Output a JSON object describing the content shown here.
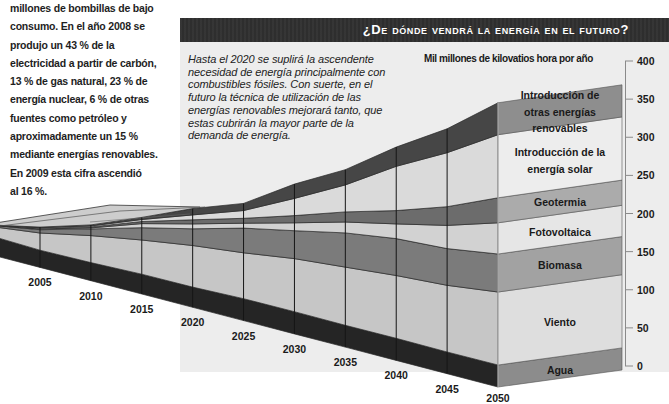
{
  "left_column": {
    "lines": [
      "millones de bombillas de bajo",
      "consumo. En el año 2008 se",
      "produjo un 43 % de la",
      "electricidad a partir de carbón,",
      "13 % de gas natural, 23 % de",
      "energía nuclear, 6 % de otras",
      "fuentes como petróleo y",
      "aproximadamente un 15 %",
      "mediante energías renovables.",
      "En 2009 esta cifra ascendió",
      "al 16 %."
    ]
  },
  "title_bar": {
    "title": "¿De dónde vendrá la energía en el futuro?",
    "background": "#2f2f2f"
  },
  "intro": {
    "lines": [
      "Hasta el 2020 se suplirá la ascendente",
      "necesidad de energía principalmente con",
      "combustibles fósiles. Con suerte, en el",
      "futuro la técnica de utilización de las",
      "energías renovables mejorará tanto, que",
      "estas cubrirán la mayor parte de la",
      "demanda de energía."
    ]
  },
  "chart_data": {
    "type": "area",
    "subtype": "stacked-3d-perspective",
    "title": "¿De dónde vendrá la energía en el futuro?",
    "xlabel": "",
    "ylabel": "Mil millones de kilovatios hora por año",
    "x": [
      2000,
      2005,
      2010,
      2015,
      2020,
      2025,
      2030,
      2035,
      2040,
      2045,
      2050
    ],
    "x_tick_labels": [
      "2005",
      "2010",
      "2015",
      "2020",
      "2025",
      "2030",
      "2035",
      "2040",
      "2045",
      "2050"
    ],
    "yticks": [
      0,
      50,
      100,
      150,
      200,
      250,
      300,
      350,
      400
    ],
    "ylim": [
      0,
      400
    ],
    "y_axis_position": "right",
    "grid": false,
    "legend": "labels on 2050 front face",
    "series": [
      {
        "name": "Agua",
        "label": "Agua",
        "values": [
          29,
          26,
          27,
          29,
          29,
          31,
          31,
          30,
          30,
          29,
          29
        ],
        "side_color": "#252525",
        "front_color": "#8c8c8c"
      },
      {
        "name": "Viento",
        "label": "Viento",
        "values": [
          14,
          26,
          40,
          50,
          60,
          65,
          74,
          80,
          85,
          89,
          96
        ],
        "side_color": "#c6c6c6",
        "front_color": "#dedede"
      },
      {
        "name": "Biomasa",
        "label": "Biomasa",
        "values": [
          2,
          5,
          10,
          18,
          24,
          35,
          39,
          47,
          50,
          49,
          50
        ],
        "side_color": "#7b7b7b",
        "front_color": "#a2a2a2"
      },
      {
        "name": "Fotovoltaica",
        "label": "Fotovoltaica",
        "values": [
          0,
          1,
          1.5,
          6,
          7,
          7,
          11,
          15,
          20,
          31,
          41
        ],
        "side_color": "#d2d2d2",
        "front_color": "#e6e6e6"
      },
      {
        "name": "Geotermia",
        "label": "Geotermia",
        "values": [
          0,
          1,
          1.5,
          3,
          6,
          7,
          10,
          14,
          18,
          25,
          33
        ],
        "side_color": "#6c6c6c",
        "front_color": "#ababab"
      },
      {
        "name": "Introducción de la energía solar",
        "label": "Introducción de la\nenergía solar",
        "values": [
          0,
          1,
          1.5,
          3,
          7,
          11,
          24,
          37,
          60,
          72,
          83
        ],
        "side_color": "#dadada",
        "front_color": "#ededed"
      },
      {
        "name": "Introducción de otras energías renovables",
        "label": "Introducción de\notras energías\nrenovables",
        "values": [
          0,
          1,
          1.5,
          3,
          9,
          10,
          20,
          21,
          26,
          32,
          42
        ],
        "side_color": "#464646",
        "front_color": "#8e8e8e"
      }
    ]
  }
}
